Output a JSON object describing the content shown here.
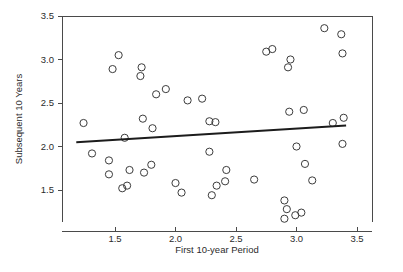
{
  "chart_data": {
    "type": "scatter",
    "title": "",
    "subtitle": "",
    "xlabel": "First 10-year Period",
    "ylabel": "Subsequent 10 Years",
    "xlim": [
      1.18,
      3.56
    ],
    "ylim": [
      1.12,
      3.54
    ],
    "xticks": [
      1.5,
      2.0,
      2.5,
      3.0,
      3.5
    ],
    "xticklabels": [
      "1.5",
      "2.0",
      "2.5",
      "3.0",
      "3.5"
    ],
    "yticks": [
      1.5,
      2.0,
      2.5,
      3.0,
      3.5
    ],
    "yticklabels": [
      "1.5",
      "2.0",
      "2.5",
      "3.0",
      "3.5"
    ],
    "grid": false,
    "legend": null,
    "marker": "open-circle",
    "marker_size": 4.0,
    "point_color": "#3c3c3c",
    "line_color": "#1c1c1c",
    "axis_color": "#4a4a4a",
    "background": "#ffffff",
    "points": [
      [
        1.24,
        2.27
      ],
      [
        1.31,
        1.92
      ],
      [
        1.45,
        1.84
      ],
      [
        1.45,
        1.68
      ],
      [
        1.48,
        2.89
      ],
      [
        1.53,
        3.05
      ],
      [
        1.56,
        1.52
      ],
      [
        1.58,
        2.1
      ],
      [
        1.6,
        1.55
      ],
      [
        1.62,
        1.73
      ],
      [
        1.71,
        2.81
      ],
      [
        1.72,
        2.91
      ],
      [
        1.73,
        2.32
      ],
      [
        1.74,
        1.7
      ],
      [
        1.8,
        1.79
      ],
      [
        1.81,
        2.21
      ],
      [
        1.84,
        2.6
      ],
      [
        1.92,
        2.66
      ],
      [
        2.0,
        1.58
      ],
      [
        2.05,
        1.47
      ],
      [
        2.1,
        2.53
      ],
      [
        2.22,
        2.55
      ],
      [
        2.28,
        2.29
      ],
      [
        2.28,
        1.94
      ],
      [
        2.3,
        1.44
      ],
      [
        2.33,
        2.28
      ],
      [
        2.34,
        1.55
      ],
      [
        2.41,
        1.6
      ],
      [
        2.42,
        1.73
      ],
      [
        2.65,
        1.62
      ],
      [
        2.75,
        3.09
      ],
      [
        2.8,
        3.12
      ],
      [
        2.9,
        1.38
      ],
      [
        2.92,
        1.28
      ],
      [
        2.93,
        2.91
      ],
      [
        2.94,
        2.4
      ],
      [
        2.95,
        3.0
      ],
      [
        2.9,
        1.17
      ],
      [
        2.99,
        1.21
      ],
      [
        3.0,
        2.0
      ],
      [
        3.04,
        1.24
      ],
      [
        3.06,
        2.42
      ],
      [
        3.07,
        1.8
      ],
      [
        3.13,
        1.61
      ],
      [
        3.23,
        3.36
      ],
      [
        3.3,
        2.27
      ],
      [
        3.37,
        3.29
      ],
      [
        3.38,
        3.07
      ],
      [
        3.39,
        2.33
      ],
      [
        3.38,
        2.03
      ]
    ],
    "trend_line": {
      "x_start": 1.18,
      "y_start": 2.05,
      "x_end": 3.41,
      "y_end": 2.24,
      "slope": 0.085,
      "intercept": 1.95
    }
  }
}
